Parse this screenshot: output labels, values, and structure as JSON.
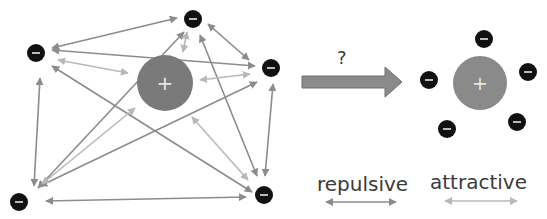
{
  "diagram": {
    "left_system": {
      "nucleus": {
        "label": "+",
        "cx": 165,
        "cy": 83,
        "r": 28,
        "color": "#7a7a7a"
      },
      "electrons": [
        {
          "id": "e1",
          "label": "-",
          "cx": 36,
          "cy": 53
        },
        {
          "id": "e2",
          "label": "-",
          "cx": 193,
          "cy": 19
        },
        {
          "id": "e3",
          "label": "-",
          "cx": 271,
          "cy": 68
        },
        {
          "id": "e4",
          "label": "-",
          "cx": 19,
          "cy": 202
        },
        {
          "id": "e5",
          "label": "-",
          "cx": 264,
          "cy": 195
        }
      ]
    },
    "transition": {
      "label": "?",
      "arrow_color": "#8a8a8a"
    },
    "right_system": {
      "nucleus": {
        "label": "+",
        "cx": 480,
        "cy": 83,
        "r": 27,
        "color": "#8a8a8a"
      },
      "electrons": [
        {
          "id": "r1",
          "label": "-",
          "cx": 484,
          "cy": 39
        },
        {
          "id": "r2",
          "label": "-",
          "cx": 429,
          "cy": 80
        },
        {
          "id": "r3",
          "label": "-",
          "cx": 528,
          "cy": 72
        },
        {
          "id": "r4",
          "label": "-",
          "cx": 517,
          "cy": 122
        },
        {
          "id": "r5",
          "label": "-",
          "cx": 447,
          "cy": 129
        }
      ]
    },
    "legend": {
      "repulsive": {
        "label": "repulsive",
        "color": "#8c8c8c"
      },
      "attractive": {
        "label": "attractive",
        "color": "#b8b8b8"
      }
    }
  }
}
